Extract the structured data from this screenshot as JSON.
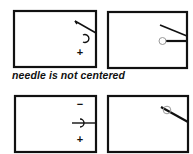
{
  "caption": "needle is not centered",
  "panels": {
    "top_left": {
      "symbol_top": "ↄ",
      "symbol_bottom": "+"
    },
    "top_right": {},
    "bottom_left": {
      "symbol_top": "−",
      "symbol_bottom": "+"
    },
    "bottom_right": {}
  },
  "colors": {
    "stroke": "#111111",
    "background": "#ffffff",
    "circle": "#888888"
  }
}
